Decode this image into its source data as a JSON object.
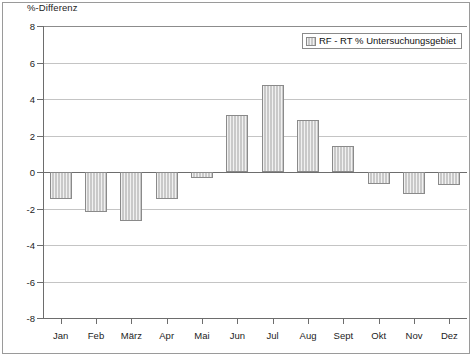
{
  "chart_data": {
    "type": "bar",
    "title": "",
    "ylabel": "%-Differenz",
    "xlabel": "",
    "categories": [
      "Jan",
      "Feb",
      "März",
      "Apr",
      "Mai",
      "Jun",
      "Jul",
      "Aug",
      "Sept",
      "Okt",
      "Nov",
      "Dez"
    ],
    "series": [
      {
        "name": "RF - RT % Untersuchungsgebiet",
        "values": [
          -1.5,
          -2.2,
          -2.7,
          -1.5,
          -0.35,
          3.15,
          4.75,
          2.85,
          1.4,
          -0.65,
          -1.2,
          -0.7
        ]
      }
    ],
    "ylim": [
      -8,
      8
    ],
    "yticks": [
      8,
      6,
      4,
      2,
      0,
      -2,
      -4,
      -6,
      -8
    ],
    "ytick_labels": [
      "8",
      "6",
      "4",
      "2",
      "0",
      "-2",
      "-4",
      "-6",
      "-8"
    ],
    "grid": true,
    "legend_position": "top-right",
    "bar_color": "#c9c9c9",
    "bar_edge_color": "#8a8a8a",
    "grid_color": "#c4c4c4",
    "axis_color": "#6d6d6d"
  },
  "legend": {
    "entries": [
      {
        "label": "RF - RT % Untersuchungsgebiet",
        "swatch": "hatched-gray-swatch"
      }
    ]
  }
}
